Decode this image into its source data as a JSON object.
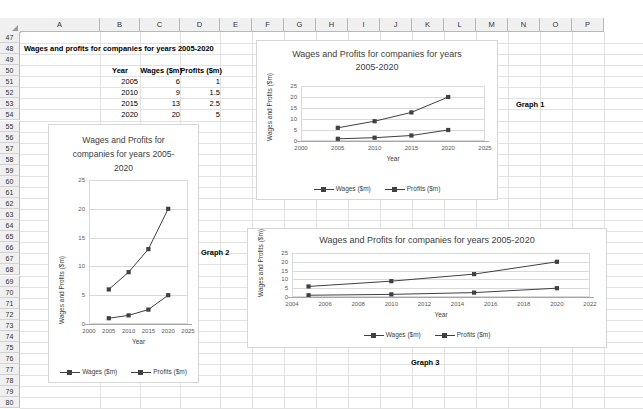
{
  "spreadsheet": {
    "columns": [
      "A",
      "B",
      "C",
      "D",
      "E",
      "F",
      "G",
      "H",
      "I",
      "J",
      "K",
      "L",
      "M",
      "N",
      "O",
      "P"
    ],
    "rows": [
      "47",
      "48",
      "49",
      "50",
      "51",
      "52",
      "53",
      "54",
      "55",
      "56",
      "57",
      "58",
      "59",
      "60",
      "61",
      "62",
      "63",
      "64",
      "65",
      "66",
      "67",
      "68",
      "69",
      "70",
      "71",
      "72",
      "73",
      "74",
      "75",
      "76",
      "77",
      "78",
      "79",
      "80"
    ],
    "title": "Wages and profits for companies for years 2005-2020",
    "table": {
      "headers": [
        "Year",
        "Wages ($m)",
        "Profits ($m)"
      ],
      "rows": [
        [
          "2005",
          "6",
          "1"
        ],
        [
          "2010",
          "9",
          "1.5"
        ],
        [
          "2015",
          "13",
          "2.5"
        ],
        [
          "2020",
          "20",
          "5"
        ]
      ]
    },
    "labels": {
      "graph1": "Graph 1",
      "graph2": "Graph 2",
      "graph3": "Graph 3"
    }
  },
  "chart_data": [
    {
      "id": "graph1",
      "type": "line",
      "title": "Wages and Profits for companies for years 2005-2020",
      "title_lines": [
        "Wages and Profits for companies for years",
        "2005-2020"
      ],
      "xlabel": "Year",
      "ylabel": "Wages and Profits ($m)",
      "x": [
        2005,
        2010,
        2015,
        2020
      ],
      "series": [
        {
          "name": "Wages ($m)",
          "values": [
            6,
            9,
            13,
            20
          ]
        },
        {
          "name": "Profits ($m)",
          "values": [
            1,
            1.5,
            2.5,
            5
          ]
        }
      ],
      "xlim": [
        2000,
        2025
      ],
      "ylim": [
        0,
        25
      ],
      "xticks": [
        2000,
        2005,
        2010,
        2015,
        2020,
        2025
      ],
      "yticks": [
        0,
        5,
        10,
        15,
        20,
        25
      ],
      "grid": true,
      "legend_position": "bottom",
      "color": "#404040"
    },
    {
      "id": "graph2",
      "type": "line",
      "title": "Wages and Profits for companies for years 2005-2020",
      "title_lines": [
        "Wages and Profits for",
        "companies for years 2005-",
        "2020"
      ],
      "xlabel": "Year",
      "ylabel": "Wages and Profits ($m)",
      "x": [
        2005,
        2010,
        2015,
        2020
      ],
      "series": [
        {
          "name": "Wages ($m)",
          "values": [
            6,
            9,
            13,
            20
          ]
        },
        {
          "name": "Profits ($m)",
          "values": [
            1,
            1.5,
            2.5,
            5
          ]
        }
      ],
      "xlim": [
        2000,
        2025
      ],
      "ylim": [
        0,
        25
      ],
      "xticks": [
        2000,
        2005,
        2010,
        2015,
        2020,
        2025
      ],
      "yticks": [
        0,
        5,
        10,
        15,
        20,
        25
      ],
      "grid": true,
      "legend_position": "bottom",
      "color": "#404040"
    },
    {
      "id": "graph3",
      "type": "line",
      "title": "Wages and Profits for companies for years 2005-2020",
      "title_lines": [
        "Wages and Profits for companies for years 2005-2020"
      ],
      "xlabel": "Year",
      "ylabel": "Wages and Profits ($m)",
      "x": [
        2005,
        2010,
        2015,
        2020
      ],
      "series": [
        {
          "name": "Wages ($m)",
          "values": [
            6,
            9,
            13,
            20
          ]
        },
        {
          "name": "Profits ($m)",
          "values": [
            1,
            1.5,
            2.5,
            5
          ]
        }
      ],
      "xlim": [
        2004,
        2022
      ],
      "ylim": [
        0,
        25
      ],
      "xticks": [
        2004,
        2006,
        2008,
        2010,
        2012,
        2014,
        2016,
        2018,
        2020,
        2022
      ],
      "yticks": [
        0,
        5,
        10,
        15,
        20,
        25
      ],
      "grid": true,
      "legend_position": "bottom",
      "color": "#404040"
    }
  ]
}
